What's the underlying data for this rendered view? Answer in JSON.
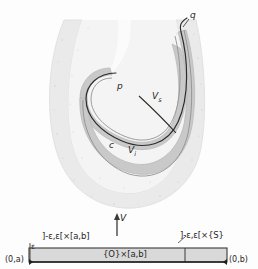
{
  "figure": {
    "type": "hand-drawn-math-diagram",
    "colors": {
      "outer_region_fill": "#ededed",
      "band_fill": "#c9c9c9",
      "curve_stroke": "#2b2b2b",
      "bar_fill": "#d9d9d9",
      "bar_stroke": "#3a3a3a",
      "text": "#262626"
    }
  },
  "upper_diagram": {
    "labels": {
      "point_q": "q",
      "point_p": "p",
      "curve_c": "c",
      "v_s": "V",
      "v_s_sub": "s",
      "v_i": "V",
      "v_i_sub": "i"
    }
  },
  "middle": {
    "flow_arrow_label": "V"
  },
  "lower_diagram": {
    "left_bracket_label": "]-ε,ε[×[a,b]",
    "right_bracket_label": "]-ε,ε[×{S}",
    "center_box_label": "{O}×[a,b]",
    "epsilon_label": "ε",
    "corner_left": "(0,a)",
    "corner_right": "(0,b)"
  }
}
